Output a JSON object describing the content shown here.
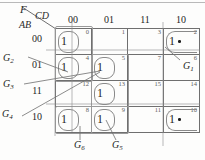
{
  "figure": {
    "type": "karnaugh-map",
    "function_label": "F",
    "col_var_label": "CD",
    "row_var_label": "AB",
    "col_headers": [
      "00",
      "01",
      "11",
      "10"
    ],
    "row_headers": [
      "00",
      "01",
      "11",
      "10"
    ]
  },
  "cells": [
    {
      "index": "0",
      "row": 0,
      "col": 0,
      "value": "1",
      "dot": false
    },
    {
      "index": "1",
      "row": 0,
      "col": 1,
      "value": "",
      "dot": false
    },
    {
      "index": "3",
      "row": 0,
      "col": 2,
      "value": "",
      "dot": false
    },
    {
      "index": "2",
      "row": 0,
      "col": 3,
      "value": "1",
      "dot": true
    },
    {
      "index": "4",
      "row": 1,
      "col": 0,
      "value": "1",
      "dot": false
    },
    {
      "index": "5",
      "row": 1,
      "col": 1,
      "value": "1",
      "dot": false
    },
    {
      "index": "7",
      "row": 1,
      "col": 2,
      "value": "",
      "dot": false
    },
    {
      "index": "6",
      "row": 1,
      "col": 3,
      "value": "",
      "dot": false
    },
    {
      "index": "12",
      "row": 2,
      "col": 0,
      "value": "",
      "dot": false
    },
    {
      "index": "13",
      "row": 2,
      "col": 1,
      "value": "1",
      "dot": false
    },
    {
      "index": "15",
      "row": 2,
      "col": 2,
      "value": "",
      "dot": false
    },
    {
      "index": "14",
      "row": 2,
      "col": 3,
      "value": "",
      "dot": false
    },
    {
      "index": "8",
      "row": 3,
      "col": 0,
      "value": "1",
      "dot": false
    },
    {
      "index": "9",
      "row": 3,
      "col": 1,
      "value": "1",
      "dot": false
    },
    {
      "index": "11",
      "row": 3,
      "col": 2,
      "value": "",
      "dot": false
    },
    {
      "index": "10",
      "row": 3,
      "col": 3,
      "value": "1",
      "dot": true
    }
  ],
  "groups": [
    {
      "id": "G1",
      "label": "G",
      "subscript": "1"
    },
    {
      "id": "G2",
      "label": "G",
      "subscript": "2"
    },
    {
      "id": "G3",
      "label": "G",
      "subscript": "3"
    },
    {
      "id": "G4",
      "label": "G",
      "subscript": "4"
    },
    {
      "id": "G5",
      "label": "G",
      "subscript": "5"
    },
    {
      "id": "G6",
      "label": "G",
      "subscript": "6"
    }
  ],
  "colors": {
    "grid_line": "#6f6f6f",
    "group_outline": "#8a8a8a",
    "text": "#1d1d1d",
    "cell_index": "#5d5d5d",
    "background": "#fdfdfc"
  }
}
